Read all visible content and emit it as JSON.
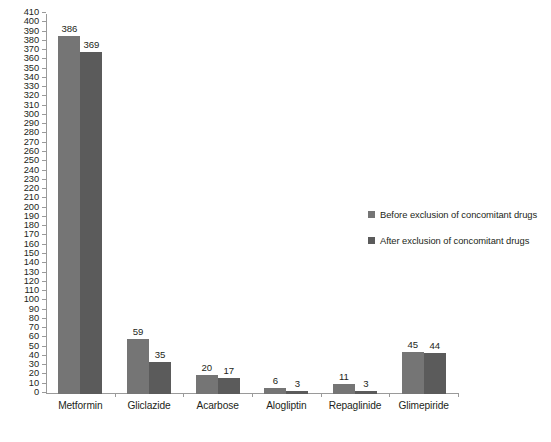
{
  "chart_data": {
    "type": "bar",
    "title": "",
    "subtitle": "",
    "xlabel": "",
    "ylabel": "",
    "categories": [
      "Metformin",
      "Gliclazide",
      "Acarbose",
      "Alogliptin",
      "Repaglinide",
      "Glimepiride"
    ],
    "series": [
      {
        "name": "Before exclusion of concomitant drugs",
        "color": "#757575",
        "values": [
          386,
          59,
          20,
          6,
          11,
          45
        ]
      },
      {
        "name": "After exclusion of concomitant drugs",
        "color": "#5b5b5b",
        "values": [
          369,
          35,
          17,
          3,
          3,
          44
        ]
      }
    ],
    "ylim": [
      0,
      410
    ],
    "ytick_step": 10,
    "yticks": [
      0,
      10,
      20,
      30,
      40,
      50,
      60,
      70,
      80,
      90,
      100,
      110,
      120,
      130,
      140,
      150,
      160,
      170,
      180,
      190,
      200,
      210,
      220,
      230,
      240,
      250,
      260,
      270,
      280,
      290,
      300,
      310,
      320,
      330,
      340,
      350,
      360,
      370,
      380,
      390,
      400,
      410
    ],
    "grid": false,
    "data_labels": true,
    "legend_position": "right"
  },
  "legend": {
    "entries": [
      {
        "label": "Before exclusion of concomitant drugs"
      },
      {
        "label": "After exclusion of concomitant drugs"
      }
    ]
  }
}
